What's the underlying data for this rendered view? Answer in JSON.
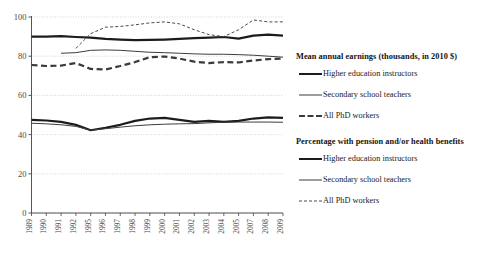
{
  "chart_data": {
    "type": "line",
    "title": "",
    "xlabel": "",
    "ylabel": "",
    "ylim": [
      0,
      100
    ],
    "yticks": [
      0,
      20,
      40,
      60,
      80,
      100
    ],
    "grid": true,
    "legend_position": "right",
    "x": [
      "1989",
      "1990",
      "1991",
      "1992",
      "1995",
      "1996",
      "1997",
      "1998",
      "1999",
      "2000",
      "2001",
      "2002",
      "2003",
      "2004",
      "2005",
      "2007",
      "2008",
      "2009"
    ],
    "categories": [
      "1989",
      "1990",
      "1991",
      "1992",
      "1995",
      "1996",
      "1997",
      "1998",
      "1999",
      "2000",
      "2001",
      "2002",
      "2003",
      "2004",
      "2005",
      "2007",
      "2008",
      "2009"
    ],
    "series": [
      {
        "name": "Mean annual earnings (thousands, in 2010 $) - Higher education instructors",
        "group": "Mean annual earnings (thousands, in 2010 $)",
        "label": "Higher education instructors",
        "style": "thick-solid",
        "color": "#1c1c1c",
        "values": [
          47.5,
          47.2,
          46.5,
          45.0,
          42.2,
          43.5,
          45.0,
          47.0,
          48.2,
          48.5,
          47.5,
          46.5,
          47.0,
          46.5,
          47.0,
          48.2,
          48.8,
          48.5
        ]
      },
      {
        "name": "Mean annual earnings (thousands, in 2010 $) - Secondary school teachers",
        "group": "Mean annual earnings (thousands, in 2010 $)",
        "label": "Secondary school teachers",
        "style": "thin-solid",
        "color": "#3d3d3d",
        "values": [
          45.8,
          45.5,
          45.0,
          44.2,
          42.2,
          43.0,
          43.8,
          44.5,
          45.0,
          45.3,
          45.5,
          45.6,
          46.0,
          46.3,
          46.4,
          46.4,
          46.4,
          46.3
        ]
      },
      {
        "name": "Mean annual earnings (thousands, in 2010 $) - All PhD workers",
        "group": "Mean annual earnings (thousands, in 2010 $)",
        "label": "All PhD workers",
        "style": "thick-dashed",
        "color": "#3a3a3a",
        "values": [
          75.5,
          75.0,
          75.2,
          76.5,
          73.5,
          73.2,
          75.0,
          77.0,
          79.5,
          79.8,
          78.8,
          77.2,
          76.5,
          77.0,
          76.8,
          77.8,
          78.5,
          78.8
        ]
      },
      {
        "name": "Percentage with pension and/or health benefits - Higher education instructors",
        "group": "Percentage with pension and/or health benefits",
        "label": "Higher education instructors",
        "style": "thick-solid",
        "color": "#1c1c1c",
        "values": [
          90.0,
          90.0,
          90.2,
          89.8,
          89.5,
          88.8,
          88.5,
          88.2,
          88.3,
          88.5,
          88.8,
          89.2,
          89.5,
          89.8,
          89.0,
          90.5,
          91.0,
          90.5
        ]
      },
      {
        "name": "Percentage with pension and/or health benefits - Secondary school teachers",
        "group": "Percentage with pension and/or health benefits",
        "label": "Secondary school teachers",
        "style": "thin-solid",
        "color": "#3d3d3d",
        "values": [
          null,
          null,
          81.5,
          81.8,
          83.0,
          83.2,
          83.0,
          82.5,
          82.0,
          81.8,
          81.5,
          81.2,
          81.0,
          81.0,
          80.8,
          80.5,
          80.0,
          79.5
        ]
      },
      {
        "name": "Percentage with pension and/or health benefits - All PhD workers",
        "group": "Percentage with pension and/or health benefits",
        "label": "All PhD workers",
        "style": "thin-dashed",
        "color": "#4a4a4a",
        "values": [
          null,
          null,
          null,
          84.0,
          91.5,
          94.8,
          95.2,
          96.0,
          97.0,
          97.5,
          96.5,
          93.5,
          91.0,
          90.0,
          93.5,
          98.5,
          97.5,
          97.5
        ]
      }
    ]
  },
  "legend": {
    "blocks": [
      {
        "title": "Mean annual earnings (thousands, in 2010 $)",
        "rows": [
          {
            "label": "Higher education instructors",
            "style": "thick-solid"
          },
          {
            "label": "Secondary school teachers",
            "style": "thin-solid"
          },
          {
            "label": "All PhD workers",
            "style": "thick-dashed"
          }
        ]
      },
      {
        "title": "Percentage with pension and/or health benefits",
        "rows": [
          {
            "label": "Higher education instructors",
            "style": "thick-solid"
          },
          {
            "label": "Secondary school teachers",
            "style": "thin-solid"
          },
          {
            "label": "All PhD workers",
            "style": "thin-dashed"
          }
        ]
      }
    ]
  },
  "colors": {
    "thick_solid": "#1c1c1c",
    "thin_solid": "#3d3d3d",
    "thick_dashed": "#3a3a3a",
    "thin_dashed": "#4a4a4a",
    "axis": "#555555",
    "grid": "#c9c9c9",
    "background": "#ffffff"
  }
}
